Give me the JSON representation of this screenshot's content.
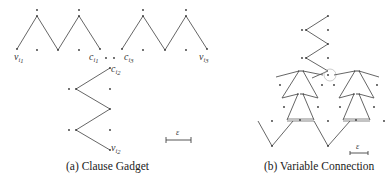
{
  "figure": {
    "subfigures": [
      {
        "id": "a",
        "caption": "(a) Clause Gadget",
        "title": "Clause Gadget",
        "vertex_labels": [
          {
            "base": "v",
            "sub": "i",
            "subsub": "1"
          },
          {
            "base": "c",
            "sub": "i",
            "subsub": "1"
          },
          {
            "base": "c",
            "sub": "i",
            "subsub": "3"
          },
          {
            "base": "v",
            "sub": "i",
            "subsub": "3"
          },
          {
            "base": "c",
            "sub": "i",
            "subsub": "2"
          },
          {
            "base": "v",
            "sub": "i",
            "subsub": "2"
          }
        ],
        "scale_label": "ε"
      },
      {
        "id": "b",
        "caption": "(b) Variable Connection",
        "title": "Variable Connection",
        "scale_label": "ε"
      }
    ]
  },
  "labels": {
    "v_i1": "v",
    "v_i1_sub": "i",
    "v_i1_subsub": "1",
    "c_i1": "c",
    "c_i1_sub": "i",
    "c_i1_subsub": "1",
    "c_i3": "c",
    "c_i3_sub": "i",
    "c_i3_subsub": "3",
    "v_i3": "v",
    "v_i3_sub": "i",
    "v_i3_subsub": "3",
    "c_i2": "c",
    "c_i2_sub": "i",
    "c_i2_subsub": "2",
    "v_i2": "v",
    "v_i2_sub": "i",
    "v_i2_subsub": "2",
    "eps_a": "ε",
    "eps_b": "ε"
  },
  "captions": {
    "a": "(a) Clause Gadget",
    "b": "(b) Variable Connection"
  }
}
